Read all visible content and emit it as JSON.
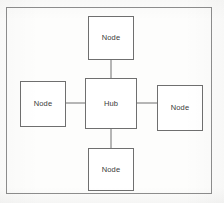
{
  "diagram": {
    "type": "node-link",
    "frame": {
      "name": "outer-border",
      "stroke_color": "#8e8e8e"
    },
    "style": {
      "background_color": "#fdfdfc",
      "box_fill": "#ffffff",
      "box_stroke": "#6f6f6f",
      "connector_stroke": "#6f6f6f",
      "label_color": "#3a3a3a"
    },
    "nodes": [
      {
        "id": "top",
        "label": "Node",
        "role": "spoke",
        "position": "top"
      },
      {
        "id": "left",
        "label": "Node",
        "role": "spoke",
        "position": "left"
      },
      {
        "id": "hub",
        "label": "Hub",
        "role": "center",
        "position": "center"
      },
      {
        "id": "right",
        "label": "Node",
        "role": "spoke",
        "position": "right"
      },
      {
        "id": "bottom",
        "label": "Node",
        "role": "spoke",
        "position": "bottom"
      }
    ],
    "connections": [
      {
        "from": "hub",
        "to": "top",
        "name": "hub-to-top-connector"
      },
      {
        "from": "hub",
        "to": "left",
        "name": "hub-to-left-connector"
      },
      {
        "from": "hub",
        "to": "right",
        "name": "hub-to-right-connector"
      },
      {
        "from": "hub",
        "to": "bottom",
        "name": "hub-to-bottom-connector"
      }
    ]
  }
}
